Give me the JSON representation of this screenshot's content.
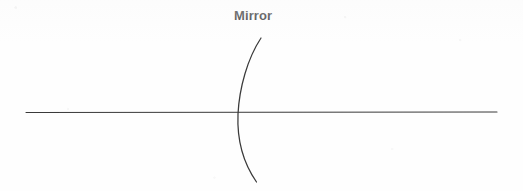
{
  "figure": {
    "kind": "optics-ray-diagram",
    "title": "Mirror",
    "background_color": "#fefefe",
    "ink_color": "#3a3a3a",
    "label_color": "#1d1d1f",
    "width": 523,
    "height": 191,
    "labels": [
      {
        "id": "mirror-label",
        "text": "Mirror",
        "x": 234,
        "y": 8
      }
    ],
    "elements": {
      "optical_axis": {
        "name": "optical-axis",
        "type": "line",
        "x1": 26,
        "y1": 112.5,
        "x2": 497,
        "y2": 112.0,
        "stroke": "#3a3a3a",
        "stroke_width": 1.1
      },
      "mirror_arc": {
        "name": "concave-mirror-arc",
        "type": "arc",
        "orientation": "concave-left",
        "top_end": {
          "x": 261,
          "y": 38
        },
        "vertex": {
          "x": 237.8,
          "y": 114
        },
        "bottom_end": {
          "x": 256.5,
          "y": 182
        },
        "stroke": "#3a3a3a",
        "stroke_width": 1.25,
        "path": "M 261 38 C 247.5 58.5 239.4 87.5 238.0 114.0 C 236.9 140.0 244.0 164.0 256.5 182.0"
      }
    }
  }
}
